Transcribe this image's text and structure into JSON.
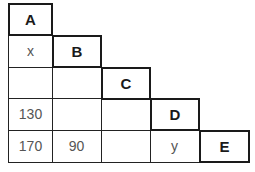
{
  "diagram": {
    "type": "triangular-distance-table",
    "headers": [
      "A",
      "B",
      "C",
      "D",
      "E"
    ],
    "rows": [
      {
        "header": "A",
        "values": []
      },
      {
        "header": "B",
        "values": [
          "x"
        ]
      },
      {
        "header": "C",
        "values": [
          "",
          ""
        ]
      },
      {
        "header": "D",
        "values": [
          "130",
          "",
          ""
        ]
      },
      {
        "header": "E",
        "values": [
          "170",
          "90",
          "",
          "y"
        ]
      }
    ]
  }
}
